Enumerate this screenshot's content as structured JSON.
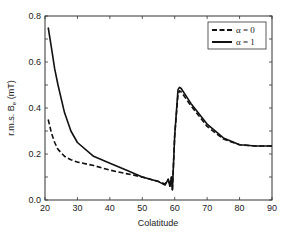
{
  "chart_data": {
    "type": "line",
    "title": "",
    "xlabel": "Colatitude",
    "ylabel": "r.m.s. Bₑ (mT)",
    "ylabel_main": "r.m.s. B",
    "ylabel_sub": "e",
    "ylabel_unit": " (mT)",
    "xlim": [
      20,
      90
    ],
    "ylim": [
      0.0,
      0.8
    ],
    "xticks": [
      20,
      30,
      40,
      50,
      60,
      70,
      80,
      90
    ],
    "xtick_labels": [
      "20",
      "30",
      "40",
      "50",
      "60",
      "70",
      "80",
      "90"
    ],
    "yticks": [
      0.0,
      0.2,
      0.4,
      0.6,
      0.8
    ],
    "ytick_labels": [
      "0.0",
      "0.2",
      "0.4",
      "0.6",
      "0.8"
    ],
    "grid": false,
    "legend_position": "upper right",
    "series": [
      {
        "name": "α = 0",
        "style": "dashed",
        "color": "#111111",
        "x": [
          21,
          22,
          23,
          24,
          26,
          28,
          30,
          35,
          40,
          45,
          50,
          55,
          57,
          58,
          58.5,
          59,
          59.3,
          60,
          61,
          61.5,
          62,
          65,
          70,
          75,
          80,
          85,
          90
        ],
        "y": [
          0.35,
          0.29,
          0.25,
          0.22,
          0.19,
          0.175,
          0.165,
          0.15,
          0.13,
          0.115,
          0.1,
          0.08,
          0.07,
          0.09,
          0.06,
          0.1,
          0.045,
          0.28,
          0.46,
          0.475,
          0.47,
          0.41,
          0.32,
          0.265,
          0.24,
          0.235,
          0.235
        ]
      },
      {
        "name": "α = 1",
        "style": "solid",
        "color": "#111111",
        "x": [
          21,
          22,
          23,
          24,
          26,
          28,
          30,
          35,
          40,
          45,
          50,
          55,
          57,
          58,
          58.5,
          59,
          59.3,
          60,
          61,
          61.5,
          62,
          65,
          70,
          75,
          80,
          85,
          90
        ],
        "y": [
          0.75,
          0.66,
          0.57,
          0.5,
          0.38,
          0.3,
          0.25,
          0.19,
          0.16,
          0.13,
          0.1,
          0.08,
          0.065,
          0.09,
          0.06,
          0.1,
          0.045,
          0.28,
          0.48,
          0.49,
          0.485,
          0.42,
          0.33,
          0.27,
          0.24,
          0.235,
          0.235
        ]
      }
    ]
  },
  "legend": {
    "items": [
      {
        "label": "α = 0",
        "style": "dashed"
      },
      {
        "label": "α = 1",
        "style": "solid"
      }
    ]
  }
}
